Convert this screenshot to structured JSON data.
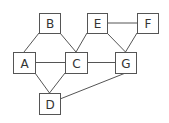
{
  "diagram": {
    "type": "graph",
    "colors": {
      "stroke": "#555555",
      "fill": "#ffffff",
      "text": "#333333"
    },
    "nodes": [
      {
        "id": "A",
        "label": "A",
        "x": 13,
        "y": 52,
        "w": 22,
        "h": 21
      },
      {
        "id": "B",
        "label": "B",
        "x": 39,
        "y": 13,
        "w": 21,
        "h": 20
      },
      {
        "id": "C",
        "label": "C",
        "x": 65,
        "y": 52,
        "w": 22,
        "h": 21
      },
      {
        "id": "D",
        "label": "D",
        "x": 39,
        "y": 93,
        "w": 21,
        "h": 21
      },
      {
        "id": "E",
        "label": "E",
        "x": 87,
        "y": 13,
        "w": 20,
        "h": 20
      },
      {
        "id": "F",
        "label": "F",
        "x": 137,
        "y": 13,
        "w": 21,
        "h": 20
      },
      {
        "id": "G",
        "label": "G",
        "x": 115,
        "y": 52,
        "w": 21,
        "h": 21
      }
    ],
    "edges": [
      [
        "B",
        "A"
      ],
      [
        "B",
        "C"
      ],
      [
        "A",
        "C"
      ],
      [
        "A",
        "D"
      ],
      [
        "C",
        "D"
      ],
      [
        "C",
        "E"
      ],
      [
        "C",
        "G"
      ],
      [
        "E",
        "F"
      ],
      [
        "E",
        "G"
      ],
      [
        "F",
        "G"
      ],
      [
        "G",
        "D"
      ]
    ]
  }
}
